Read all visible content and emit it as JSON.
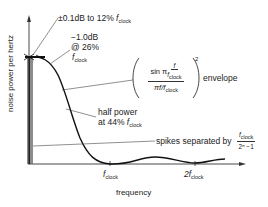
{
  "diagram": {
    "type": "spectrum-plot",
    "axes": {
      "y_label": "noise power per hertz",
      "x_label": "frequency",
      "x_ticks": [
        {
          "main": "f",
          "sub": "clock"
        },
        {
          "main": "2f",
          "sub": "clock"
        }
      ]
    },
    "annotations": {
      "flatness": {
        "text": "±0.1dB to 12% ",
        "var": "f",
        "sub": "clock"
      },
      "minus1db": {
        "line1": "−1.0dB",
        "line2": "@ 26%",
        "var": "f",
        "sub": "clock"
      },
      "envelope": {
        "num_prefix": "sin π ",
        "num_frac_top": "f",
        "num_frac_bottom_var": "f",
        "num_frac_bottom_sub": "clock",
        "den": "πf/f",
        "den_sub": "clock",
        "exponent": "2",
        "suffix": "envelope"
      },
      "half_power": {
        "line1": "half power",
        "line2": "at 44% ",
        "var": "f",
        "sub": "clock"
      },
      "spikes": {
        "text": "spikes separated by",
        "frac_top_var": "f",
        "frac_top_sub": "clock",
        "frac_bottom": "2ⁿ −1"
      }
    },
    "colors": {
      "curve": "#111111",
      "axis": "#333333",
      "spike_bar": "#555555",
      "leader": "#444444"
    }
  }
}
